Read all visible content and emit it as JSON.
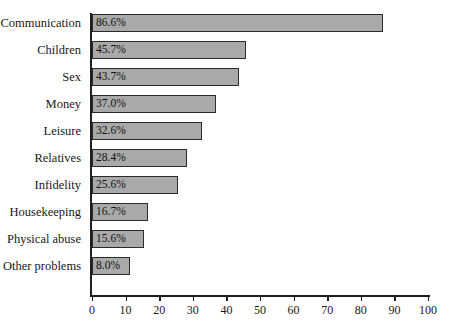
{
  "chart_data": {
    "type": "bar",
    "orientation": "horizontal",
    "title": "",
    "subtitle": "",
    "xlabel": "",
    "ylabel": "",
    "xlim": [
      0,
      100
    ],
    "xticks": [
      0,
      10,
      20,
      30,
      40,
      50,
      60,
      70,
      80,
      90,
      100
    ],
    "xtick_labels": [
      "0",
      "10",
      "20",
      "30",
      "40",
      "50",
      "60",
      "70",
      "80",
      "90",
      "100"
    ],
    "grid": false,
    "legend": null,
    "categories": [
      "Communication",
      "Children",
      "Sex",
      "Money",
      "Leisure",
      "Relatives",
      "Infidelity",
      "Housekeeping",
      "Physical abuse",
      "Other problems"
    ],
    "values": [
      86.6,
      45.7,
      43.7,
      37.0,
      32.6,
      28.4,
      25.6,
      16.7,
      15.6,
      8.0
    ],
    "value_labels": [
      "86.6%",
      "45.7%",
      "43.7%",
      "37.0%",
      "32.6%",
      "28.4%",
      "25.6%",
      "16.7%",
      "15.6%",
      "8.0%"
    ],
    "bar_fill_color": "#a9a9a9",
    "bar_border_color": "#2b2b2b",
    "background_color": "#ffffff",
    "axis_color": "#202020"
  },
  "bars": [
    {
      "label": "Communication",
      "value_label": "86.6%",
      "value": 86.6
    },
    {
      "label": "Children",
      "value_label": "45.7%",
      "value": 45.7
    },
    {
      "label": "Sex",
      "value_label": "43.7%",
      "value": 43.7
    },
    {
      "label": "Money",
      "value_label": "37.0%",
      "value": 37.0
    },
    {
      "label": "Leisure",
      "value_label": "32.6%",
      "value": 32.6
    },
    {
      "label": "Relatives",
      "value_label": "28.4%",
      "value": 28.4
    },
    {
      "label": "Infidelity",
      "value_label": "25.6%",
      "value": 25.6
    },
    {
      "label": "Housekeeping",
      "value_label": "16.7%",
      "value": 16.7
    },
    {
      "label": "Physical abuse",
      "value_label": "15.6%",
      "value": 15.6
    },
    {
      "label": "Other problems",
      "value_label": "8.0%",
      "value": 8.0
    }
  ]
}
